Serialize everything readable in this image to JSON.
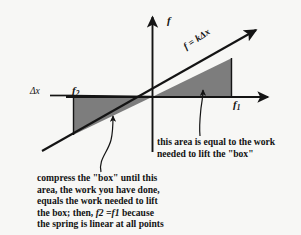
{
  "figure": {
    "type": "physics-diagram",
    "background_color": "#f7f7f5",
    "ink_color": "#141414",
    "shaded_region_color": "#7d7d7d",
    "axes": {
      "y_axis_label": "f",
      "x_axis_label": "f",
      "x_axis_label_subscript": "1",
      "origin_px": [
        152,
        97
      ]
    },
    "labels": {
      "delta_x": "Δx",
      "f2_symbol": "f",
      "f2_subscript": "2",
      "line_equation": "f = kΔx"
    },
    "shaded_areas": [
      {
        "name": "left-area",
        "quadrant": "third",
        "meaning": "work done compressing the box"
      },
      {
        "name": "right-area",
        "quadrant": "first",
        "meaning": "work needed to lift the box"
      }
    ]
  },
  "captions": {
    "right": {
      "line1": "this area is equal to the work",
      "line2": "needed to lift the \"box\""
    },
    "left": {
      "line1": "compress the \"box\" until this",
      "line2": "area, the work you have done,",
      "line3": "equals the work needed to lift",
      "line4_pre": "the box; then,",
      "line4_f2": "f2",
      "line4_eq": "=f1",
      "line4_post": "because",
      "line5": "the spring is linear at all points"
    }
  }
}
